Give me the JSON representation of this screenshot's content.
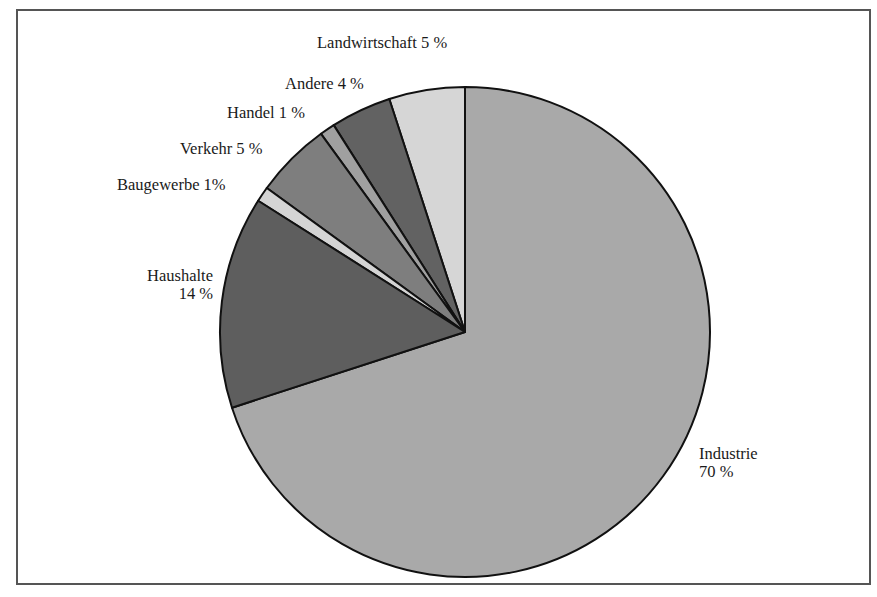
{
  "chart_data": {
    "type": "pie",
    "title": "",
    "start_angle_deg": 0,
    "direction": "counterclockwise-from-top for small slices; Industrie clockwise from top",
    "slices": [
      {
        "label": "Industrie",
        "value": 70,
        "display": "70 %",
        "color": "#a9a9a9"
      },
      {
        "label": "Haushalte",
        "value": 14,
        "display": "14 %",
        "color": "#5e5e5e"
      },
      {
        "label": "Baugewerbe",
        "value": 1,
        "display": "1%",
        "color": "#d4d4d4"
      },
      {
        "label": "Verkehr",
        "value": 5,
        "display": "5 %",
        "color": "#7e7e7e"
      },
      {
        "label": "Handel",
        "value": 1,
        "display": "1 %",
        "color": "#a0a0a0"
      },
      {
        "label": "Andere",
        "value": 4,
        "display": "4 %",
        "color": "#626262"
      },
      {
        "label": "Landwirtschaft",
        "value": 5,
        "display": "5 %",
        "color": "#d6d6d6"
      }
    ],
    "legend": "none (direct labels)"
  },
  "labels": {
    "landwirtschaft": "Landwirtschaft 5 %",
    "andere": "Andere  4 %",
    "handel": "Handel  1 %",
    "verkehr": "Verkehr  5 %",
    "baugewerbe": "Baugewerbe  1%",
    "haushalte_name": "Haushalte",
    "haushalte_value": "14 %",
    "industrie_name": "Industrie",
    "industrie_value": "70 %"
  }
}
